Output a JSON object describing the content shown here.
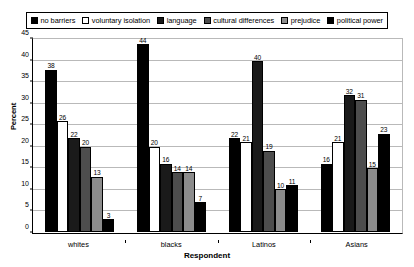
{
  "chart_data": {
    "type": "bar",
    "title": "",
    "xlabel": "Respondent",
    "ylabel": "Percent",
    "ylim": [
      0,
      45
    ],
    "ytick_step": 5,
    "yticks": [
      0,
      5,
      10,
      15,
      20,
      25,
      30,
      35,
      40,
      45
    ],
    "grid": true,
    "legend_position": "top",
    "categories": [
      "whites",
      "blacks",
      "Latinos",
      "Asians"
    ],
    "series": [
      {
        "name": "no barriers",
        "color": "#000000",
        "values": [
          38,
          44,
          22,
          16
        ]
      },
      {
        "name": "voluntary isolation",
        "color": "#ffffff",
        "values": [
          26,
          20,
          21,
          21
        ]
      },
      {
        "name": "language",
        "color": "#1a1a1a",
        "values": [
          22,
          16,
          40,
          32
        ]
      },
      {
        "name": "cultural differences",
        "color": "#4d4d4d",
        "values": [
          20,
          14,
          19,
          31
        ]
      },
      {
        "name": "prejudice",
        "color": "#8c8c8c",
        "values": [
          13,
          14,
          10,
          15
        ]
      },
      {
        "name": "political power",
        "color": "#000000",
        "values": [
          3,
          7,
          11,
          23
        ]
      }
    ]
  },
  "legend": {
    "items": [
      {
        "label": "no barriers",
        "swatch": "#000000"
      },
      {
        "label": "voluntary isolation",
        "swatch": "#ffffff"
      },
      {
        "label": "language",
        "swatch": "#1a1a1a"
      },
      {
        "label": "cultural differences",
        "swatch": "#4d4d4d"
      },
      {
        "label": "prejudice",
        "swatch": "#8c8c8c"
      },
      {
        "label": "political power",
        "swatch": "#000000"
      }
    ]
  },
  "axes": {
    "y_title": "Percent",
    "x_title": "Respondent"
  }
}
